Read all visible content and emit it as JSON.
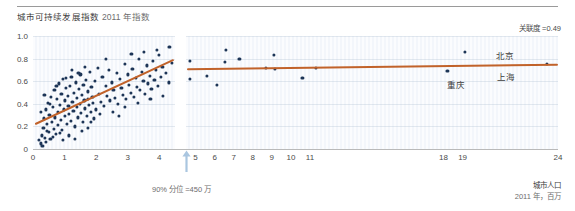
{
  "header": {
    "title": "城市可持续发展指数",
    "subtitle": "2011 年指数",
    "correlation_note": "关联度 =0.49"
  },
  "annotations": {
    "percentile_note": "90% 分位 =450 万",
    "xaxis_title": "城市人口",
    "xaxis_unit": "2011 年，百万"
  },
  "city_labels": [
    {
      "name": "北京",
      "x": 496,
      "y": 49
    },
    {
      "name": "上海",
      "x": 497,
      "y": 70
    },
    {
      "name": "重庆",
      "x": 447,
      "y": 78
    }
  ],
  "colors": {
    "dot": "#1d3557",
    "trend": "#c1622a",
    "arrow": "#aac6e0",
    "axis": "#b9b9b9",
    "grid": "#aab9cd"
  },
  "chart_data": {
    "type": "scatter",
    "xlabel": "城市人口 2011 年，百万",
    "ylabel": "城市可持续发展指数",
    "ylim": [
      0,
      1.0
    ],
    "ytick_labels": [
      "1.0",
      "0.8",
      "0.6",
      "0.4",
      "0.2",
      "0"
    ],
    "yticks": [
      1.0,
      0.8,
      0.6,
      0.4,
      0.2,
      0
    ],
    "xtick_labels": [
      "0",
      "1",
      "2",
      "3",
      "4",
      "5",
      "6",
      "7",
      "8",
      "9",
      "10",
      "11",
      "18",
      "19",
      "24"
    ],
    "xticks": [
      0,
      1,
      2,
      3,
      4,
      5,
      6,
      7,
      8,
      9,
      10,
      11,
      18,
      19,
      24
    ],
    "axis_break": true,
    "break_at": 4.5,
    "grid": true,
    "legend": "none",
    "correlation": 0.49,
    "percentile_marker": {
      "label": "90% 分位 =450 万",
      "value": 4.5
    },
    "series": [
      {
        "name": "左侧面板 散点",
        "panel": "left",
        "points": [
          [
            0.2,
            0.08
          ],
          [
            0.24,
            0.05
          ],
          [
            0.28,
            0.12
          ],
          [
            0.3,
            0.03
          ],
          [
            0.33,
            0.19
          ],
          [
            0.35,
            0.27
          ],
          [
            0.38,
            0.1
          ],
          [
            0.4,
            0.35
          ],
          [
            0.42,
            0.06
          ],
          [
            0.45,
            0.22
          ],
          [
            0.47,
            0.41
          ],
          [
            0.5,
            0.15
          ],
          [
            0.52,
            0.3
          ],
          [
            0.55,
            0.09
          ],
          [
            0.58,
            0.46
          ],
          [
            0.6,
            0.24
          ],
          [
            0.62,
            0.37
          ],
          [
            0.65,
            0.18
          ],
          [
            0.68,
            0.52
          ],
          [
            0.7,
            0.28
          ],
          [
            0.72,
            0.13
          ],
          [
            0.75,
            0.44
          ],
          [
            0.78,
            0.33
          ],
          [
            0.8,
            0.21
          ],
          [
            0.82,
            0.58
          ],
          [
            0.85,
            0.39
          ],
          [
            0.88,
            0.26
          ],
          [
            0.9,
            0.49
          ],
          [
            0.92,
            0.17
          ],
          [
            0.95,
            0.62
          ],
          [
            0.98,
            0.35
          ],
          [
            1.0,
            0.43
          ],
          [
            1.02,
            0.29
          ],
          [
            1.05,
            0.54
          ],
          [
            1.08,
            0.22
          ],
          [
            1.1,
            0.47
          ],
          [
            1.12,
            0.38
          ],
          [
            1.15,
            0.31
          ],
          [
            1.18,
            0.56
          ],
          [
            1.2,
            0.25
          ],
          [
            1.22,
            0.64
          ],
          [
            1.25,
            0.42
          ],
          [
            1.28,
            0.34
          ],
          [
            1.3,
            0.5
          ],
          [
            1.33,
            0.2
          ],
          [
            1.35,
            0.59
          ],
          [
            1.38,
            0.45
          ],
          [
            1.4,
            0.37
          ],
          [
            1.43,
            0.28
          ],
          [
            1.45,
            0.53
          ],
          [
            1.48,
            0.4
          ],
          [
            1.5,
            0.66
          ],
          [
            1.53,
            0.32
          ],
          [
            1.55,
            0.48
          ],
          [
            1.58,
            0.24
          ],
          [
            1.6,
            0.57
          ],
          [
            1.63,
            0.43
          ],
          [
            1.65,
            0.36
          ],
          [
            1.68,
            0.61
          ],
          [
            1.7,
            0.29
          ],
          [
            1.73,
            0.51
          ],
          [
            1.75,
            0.44
          ],
          [
            1.78,
            0.39
          ],
          [
            1.8,
            0.68
          ],
          [
            1.83,
            0.33
          ],
          [
            1.85,
            0.55
          ],
          [
            1.88,
            0.46
          ],
          [
            1.9,
            0.41
          ],
          [
            1.95,
            0.6
          ],
          [
            2.0,
            0.35
          ],
          [
            2.05,
            0.72
          ],
          [
            2.1,
            0.49
          ],
          [
            2.15,
            0.42
          ],
          [
            2.2,
            0.64
          ],
          [
            2.25,
            0.38
          ],
          [
            2.3,
            0.56
          ],
          [
            2.35,
            0.47
          ],
          [
            2.4,
            0.7
          ],
          [
            2.45,
            0.43
          ],
          [
            2.5,
            0.59
          ],
          [
            2.55,
            0.52
          ],
          [
            2.6,
            0.45
          ],
          [
            2.65,
            0.67
          ],
          [
            2.7,
            0.4
          ],
          [
            2.75,
            0.62
          ],
          [
            2.8,
            0.54
          ],
          [
            2.85,
            0.48
          ],
          [
            2.9,
            0.75
          ],
          [
            2.95,
            0.44
          ],
          [
            3.0,
            0.66
          ],
          [
            3.05,
            0.57
          ],
          [
            3.1,
            0.5
          ],
          [
            3.15,
            0.71
          ],
          [
            3.2,
            0.46
          ],
          [
            3.25,
            0.63
          ],
          [
            3.3,
            0.55
          ],
          [
            3.35,
            0.8
          ],
          [
            3.4,
            0.52
          ],
          [
            3.45,
            0.68
          ],
          [
            3.5,
            0.6
          ],
          [
            3.55,
            0.49
          ],
          [
            3.6,
            0.74
          ],
          [
            3.65,
            0.58
          ],
          [
            3.7,
            0.65
          ],
          [
            3.75,
            0.53
          ],
          [
            3.8,
            0.78
          ],
          [
            3.85,
            0.61
          ],
          [
            3.9,
            0.7
          ],
          [
            3.95,
            0.56
          ],
          [
            4.0,
            0.83
          ],
          [
            4.05,
            0.64
          ],
          [
            4.1,
            0.73
          ],
          [
            4.2,
            0.67
          ],
          [
            4.3,
            0.59
          ],
          [
            4.4,
            0.76
          ],
          [
            0.26,
            0.33
          ],
          [
            0.36,
            0.48
          ],
          [
            0.44,
            0.16
          ],
          [
            0.54,
            0.4
          ],
          [
            0.64,
            0.11
          ],
          [
            0.74,
            0.56
          ],
          [
            0.84,
            0.14
          ],
          [
            0.94,
            0.08
          ],
          [
            1.04,
            0.63
          ],
          [
            1.14,
            0.12
          ],
          [
            1.24,
            0.7
          ],
          [
            1.34,
            0.09
          ],
          [
            1.44,
            0.67
          ],
          [
            1.54,
            0.16
          ],
          [
            1.64,
            0.73
          ],
          [
            1.74,
            0.19
          ],
          [
            1.84,
            0.24
          ],
          [
            1.94,
            0.27
          ],
          [
            2.12,
            0.31
          ],
          [
            2.32,
            0.8
          ],
          [
            2.52,
            0.33
          ],
          [
            2.72,
            0.29
          ],
          [
            2.92,
            0.37
          ],
          [
            3.12,
            0.84
          ],
          [
            3.32,
            0.41
          ],
          [
            3.52,
            0.86
          ],
          [
            3.72,
            0.44
          ],
          [
            3.92,
            0.88
          ],
          [
            4.12,
            0.47
          ],
          [
            4.32,
            0.9
          ]
        ]
      },
      {
        "name": "右侧面板 散点",
        "panel": "right",
        "points": [
          [
            4.7,
            0.78
          ],
          [
            4.7,
            0.62
          ],
          [
            5.6,
            0.65
          ],
          [
            6.1,
            0.57
          ],
          [
            6.6,
            0.88
          ],
          [
            6.55,
            0.77
          ],
          [
            7.3,
            0.8
          ],
          [
            8.7,
            0.72
          ],
          [
            9.1,
            0.83
          ],
          [
            9.15,
            0.71
          ],
          [
            10.6,
            0.63
          ],
          [
            11.3,
            0.72
          ],
          [
            18.2,
            0.69
          ],
          [
            19.1,
            0.86
          ],
          [
            23.4,
            0.75
          ]
        ]
      }
    ],
    "trendlines": [
      {
        "panel": "left",
        "x0": 0.05,
        "y0": 0.22,
        "x1": 4.45,
        "y1": 0.79,
        "color": "#c1622a"
      },
      {
        "panel": "right",
        "x0": 4.55,
        "y0": 0.705,
        "x1": 24.0,
        "y1": 0.745,
        "color": "#c1622a"
      }
    ]
  }
}
